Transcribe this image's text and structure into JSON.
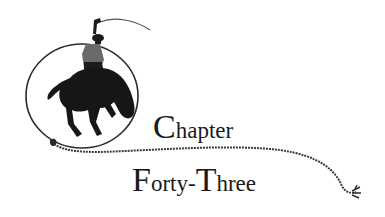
{
  "heading": {
    "line1": {
      "initial": "C",
      "rest": "hapter"
    },
    "line2": {
      "initial1": "F",
      "rest1": "orty-",
      "initial2": "T",
      "rest2": "hree"
    },
    "full_text": "Chapter Forty-Three"
  },
  "illustration": {
    "subject": "cowboy riding bucking horse inside lasso loop",
    "ink_color": "#1a1a1a",
    "rope_color": "#3a3a3a"
  }
}
